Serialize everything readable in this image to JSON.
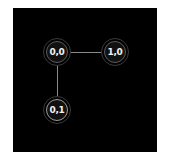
{
  "diagram": {
    "background": "#000000",
    "edge_color": "#8a8a8a",
    "nodes": [
      {
        "id": "0,0",
        "label": "0,0",
        "x": 57,
        "y": 52
      },
      {
        "id": "1,0",
        "label": "1,0",
        "x": 115,
        "y": 52
      },
      {
        "id": "0,1",
        "label": "0,1",
        "x": 57,
        "y": 110
      }
    ],
    "edges": [
      {
        "from": "0,0",
        "to": "1,0"
      },
      {
        "from": "0,0",
        "to": "0,1"
      }
    ]
  }
}
